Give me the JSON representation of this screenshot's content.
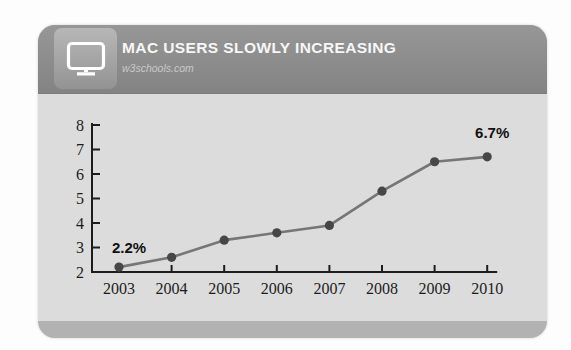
{
  "card": {
    "header": {
      "title": "MAC USERS SLOWLY INCREASING",
      "subtitle": "w3schools.com",
      "icon": "monitor-icon",
      "bg_color": "#8c8c8c",
      "title_color": "#f7f7f7",
      "subtitle_color": "#c9c9c9"
    },
    "chart_bg_color": "#dcdcdc",
    "footer_color": "#b2b2b2"
  },
  "chart_data": {
    "type": "line",
    "title": "MAC USERS SLOWLY INCREASING",
    "xlabel": "",
    "ylabel": "",
    "categories": [
      "2003",
      "2004",
      "2005",
      "2006",
      "2007",
      "2008",
      "2009",
      "2010"
    ],
    "series": [
      {
        "name": "Mac users (%)",
        "values": [
          2.2,
          2.6,
          3.3,
          3.6,
          3.9,
          5.3,
          6.5,
          6.7
        ]
      }
    ],
    "ylim": [
      2,
      8
    ],
    "yticks": [
      2,
      3,
      4,
      5,
      6,
      7,
      8
    ],
    "grid": false,
    "legend": "none",
    "annotations": [
      {
        "text": "2.2%",
        "point_index": 0,
        "position": "above-left"
      },
      {
        "text": "6.7%",
        "point_index": 7,
        "position": "above"
      }
    ],
    "line_color": "#767676",
    "point_color": "#474747",
    "axis_color": "#1c1c1c",
    "annotation_color": "#111111"
  }
}
